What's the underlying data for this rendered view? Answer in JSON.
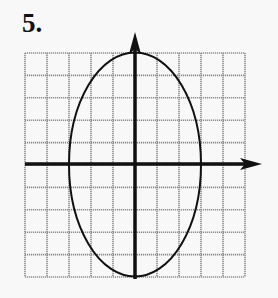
{
  "problem": {
    "number_label": "5."
  },
  "graph": {
    "grid": {
      "left": 25,
      "top": 53,
      "cols": 10,
      "rows": 10,
      "cell_w": 22,
      "cell_h": 22.4,
      "color": "#8a8a8a"
    },
    "axes": {
      "origin": [
        135,
        164
      ],
      "x_axis": {
        "from": 25,
        "to": 262,
        "arrow": "right"
      },
      "y_axis": {
        "from": 279,
        "to": 32,
        "arrow": "up"
      },
      "color": "#111111"
    },
    "ellipse": {
      "cx": 135,
      "cy": 164.5,
      "rx": 66,
      "ry": 112,
      "grid_units": {
        "semi_x": 3,
        "semi_y": 5
      },
      "color": "#111111"
    }
  },
  "chart_data": {
    "type": "diagram",
    "title": "5.",
    "x_range": [
      -5,
      5
    ],
    "y_range": [
      -5,
      5
    ],
    "ellipse": {
      "center": [
        0,
        0
      ],
      "semi_horizontal": 3,
      "semi_vertical": 5
    },
    "grid": true
  }
}
